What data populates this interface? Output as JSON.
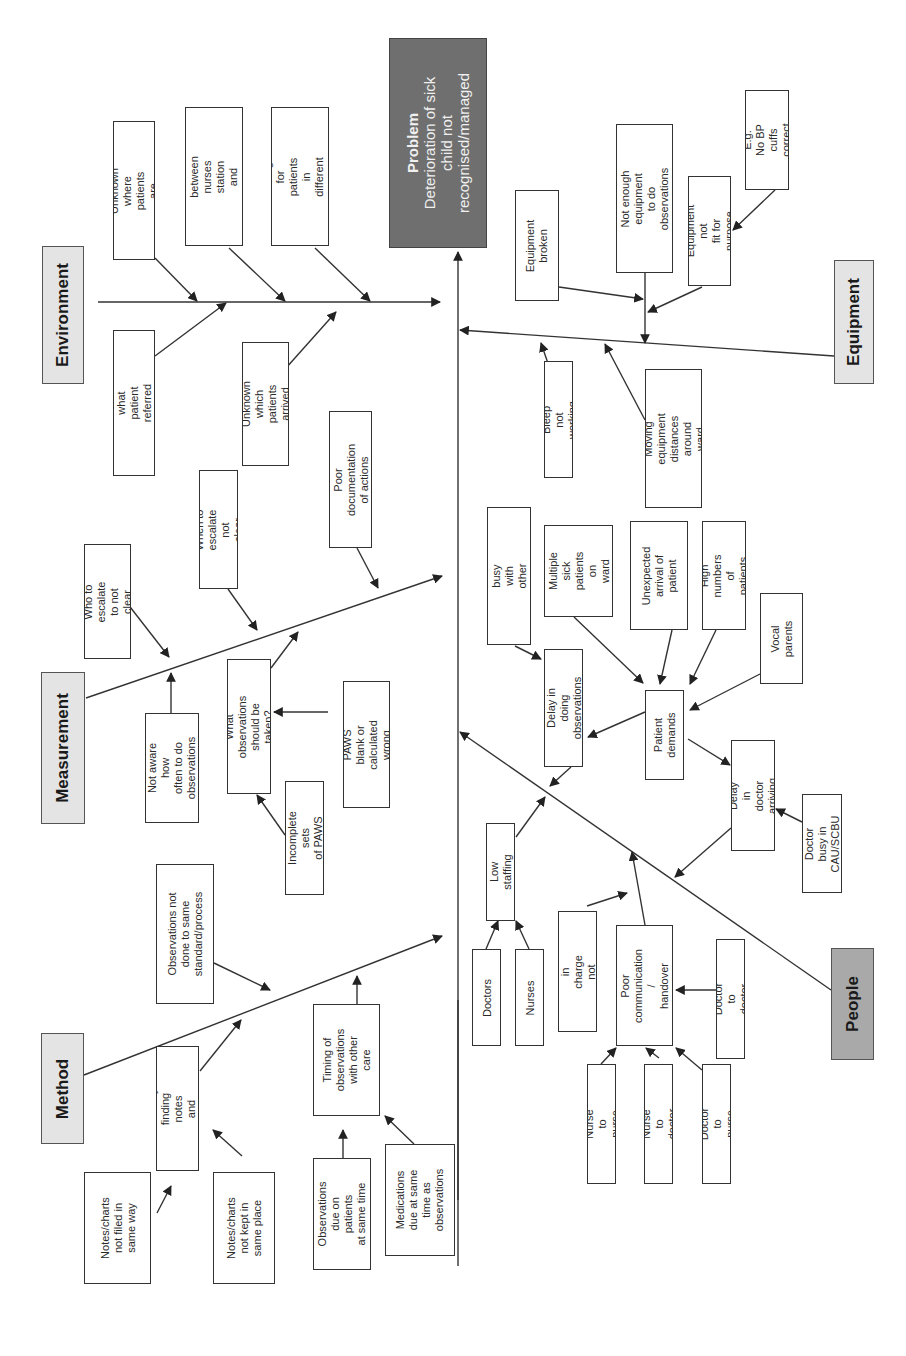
{
  "diagram": {
    "type": "fishbone",
    "orientation": "rotated-90-ccw",
    "colors": {
      "problem_fill": "#6f6f6f",
      "category_fill": "#e4e4e4",
      "people_fill": "#a9a9a9",
      "line": "#333333"
    },
    "problem": {
      "label": "Problem",
      "text": "Deterioration of sick\nchild not\nrecognised/managed"
    },
    "categories": {
      "environment": {
        "label": "Environment",
        "causes": [
          "Unknown where\npatients are",
          "Distance between\nnurses station and\nrooms",
          "Nurses caring for\npatients in different\nareas of ward",
          "Unknown what\npatient referred with",
          "Unknown which\npatients arrived"
        ]
      },
      "measurement": {
        "label": "Measurement",
        "causes": [
          "Poor documentation\nof actions",
          "When to escalate\nnot clear",
          "Who to escalate\nto not clear",
          "Not aware how\noften to do\nobservations",
          "What observations\nshould be taken?",
          "PAWS blank or\ncalculated wrong",
          "Incomplete sets\nof PAWS"
        ]
      },
      "method": {
        "label": "Method",
        "causes": [
          "Observations not\ndone to same\nstandard/process",
          "Difficulty finding\nnotes and charts",
          "Timing of\nobservations\nwith other care",
          "Notes/charts\nnot filed in\nsame way",
          "Notes/charts\nnot kept in\nsame place",
          "Observations\ndue on patients\nat same time",
          "Medications\ndue at same\ntime as\nobservations"
        ]
      },
      "equipment": {
        "label": "Equipment",
        "causes": [
          "Equipment\nbroken",
          "Not enough\nequipment to do\nobservations",
          "Equipment not\nfit for purpose",
          "E.g. No BP\ncuffs correct",
          "Bleep not working",
          "Moving equipment\ndistances around\nward"
        ]
      },
      "people": {
        "label": "People",
        "causes": [
          "Nurse busy with\nother patients",
          "Multiple sick\npatients on\nward",
          "Unexpected\narrival of\npatient",
          "High numbers\nof patients",
          "Vocal\nparents",
          "Delay in doing\nobservations",
          "Patient\ndemands",
          "Delay in doctor\narriving",
          "Doctor busy in\nCAU/SCBU",
          "Low staffing",
          "Doctors",
          "Nurses",
          "Nurse in charge\nnot aware",
          "Poor\ncommunication /\nhandover",
          "Doctor to doctor",
          "Nurse to nurse",
          "Nurse to doctor",
          "Doctor to nurse"
        ]
      }
    }
  }
}
